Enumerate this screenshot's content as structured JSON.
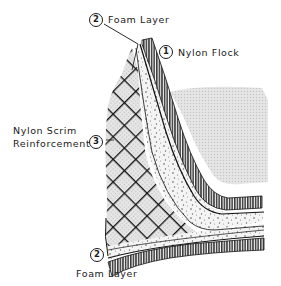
{
  "diagram": {
    "callouts": [
      {
        "number": "2",
        "label": "Foam Layer",
        "position": "top"
      },
      {
        "number": "1",
        "label": "Nylon Flock",
        "position": "right"
      },
      {
        "number": "3",
        "label_line1": "Nylon Scrim",
        "label_line2": "Reinforcement",
        "position": "left"
      },
      {
        "number": "2",
        "label": "Foam Layer",
        "position": "bottom"
      }
    ],
    "layers": [
      {
        "name": "Nylon Flock",
        "pattern": "hatched-fibers"
      },
      {
        "name": "Foam Layer",
        "pattern": "stippled"
      },
      {
        "name": "Nylon Scrim Reinforcement",
        "pattern": "crosshatch-grid"
      }
    ],
    "colors": {
      "ink": "#1a1a1a",
      "background_tone": "#dcdcdc",
      "paper": "#ffffff"
    }
  }
}
